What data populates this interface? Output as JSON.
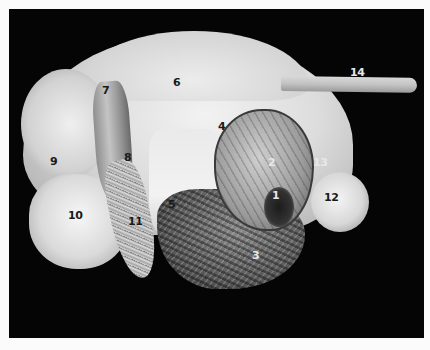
{
  "image": {
    "description": "Black-and-white anatomical specimen photograph on black background with numbered labels",
    "background_color": "#050505",
    "frame_color": "#fbfbfb"
  },
  "labels": [
    {
      "id": "1",
      "text": "1",
      "x": 272,
      "y": 190,
      "tone": "light"
    },
    {
      "id": "2",
      "text": "2",
      "x": 268,
      "y": 157,
      "tone": "light"
    },
    {
      "id": "3",
      "text": "3",
      "x": 252,
      "y": 250,
      "tone": "light"
    },
    {
      "id": "4",
      "text": "4",
      "x": 218,
      "y": 121,
      "tone": "dark"
    },
    {
      "id": "5",
      "text": "5",
      "x": 168,
      "y": 199,
      "tone": "dark"
    },
    {
      "id": "6",
      "text": "6",
      "x": 173,
      "y": 77,
      "tone": "dark"
    },
    {
      "id": "7",
      "text": "7",
      "x": 102,
      "y": 85,
      "tone": "dark"
    },
    {
      "id": "8",
      "text": "8",
      "x": 124,
      "y": 152,
      "tone": "dark"
    },
    {
      "id": "9",
      "text": "9",
      "x": 50,
      "y": 156,
      "tone": "dark"
    },
    {
      "id": "10",
      "text": "10",
      "x": 68,
      "y": 210,
      "tone": "dark"
    },
    {
      "id": "11",
      "text": "11",
      "x": 128,
      "y": 216,
      "tone": "dark"
    },
    {
      "id": "12",
      "text": "12",
      "x": 324,
      "y": 192,
      "tone": "dark"
    },
    {
      "id": "13",
      "text": "13",
      "x": 313,
      "y": 157,
      "tone": "light"
    },
    {
      "id": "14",
      "text": "14",
      "x": 350,
      "y": 67,
      "tone": "light"
    }
  ]
}
